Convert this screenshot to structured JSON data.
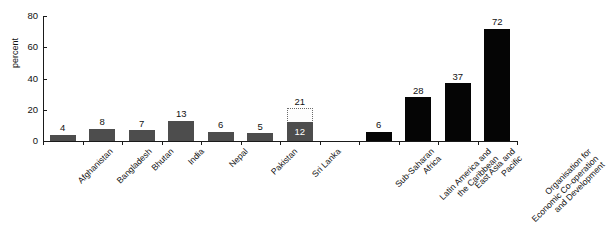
{
  "chart_data": {
    "type": "bar",
    "title": "",
    "subtitle": "",
    "xlabel": "",
    "ylabel": "percent",
    "ylim": [
      0,
      80
    ],
    "yticks": [
      0,
      20,
      40,
      60,
      80
    ],
    "grid": false,
    "legend": "none",
    "categories": [
      "Afghanistan",
      "Bangladesh",
      "Bhutan",
      "India",
      "Nepal",
      "Pakistan",
      "Sri Lanka",
      "Sub-Saharan Africa",
      "Latin America and the Caribbean",
      "East Asia and Pacific",
      "Organisation for Economic Co-operation and Development"
    ],
    "values": [
      4,
      8,
      7,
      13,
      6,
      5,
      12,
      6,
      28,
      37,
      72
    ],
    "value_labels": [
      "4",
      "8",
      "7",
      "13",
      "6",
      "5",
      "12",
      "6",
      "28",
      "37",
      "72"
    ]
  },
  "axis": {
    "y_title": "percent",
    "y_ticks": [
      "0",
      "20",
      "40",
      "60",
      "80"
    ],
    "y_max": 80
  },
  "bars": [
    {
      "name": "afghanistan",
      "label_lines": [
        "Afghanistan"
      ],
      "value": 4,
      "value_label": "4",
      "style": "gray",
      "label_pos": "above",
      "slot": 0
    },
    {
      "name": "bangladesh",
      "label_lines": [
        "Bangladesh"
      ],
      "value": 8,
      "value_label": "8",
      "style": "gray",
      "label_pos": "above",
      "slot": 1
    },
    {
      "name": "bhutan",
      "label_lines": [
        "Bhutan"
      ],
      "value": 7,
      "value_label": "7",
      "style": "gray",
      "label_pos": "above",
      "slot": 2
    },
    {
      "name": "india",
      "label_lines": [
        "India"
      ],
      "value": 13,
      "value_label": "13",
      "style": "gray",
      "label_pos": "above",
      "slot": 3
    },
    {
      "name": "nepal",
      "label_lines": [
        "Nepal"
      ],
      "value": 6,
      "value_label": "6",
      "style": "gray",
      "label_pos": "above",
      "slot": 4
    },
    {
      "name": "pakistan",
      "label_lines": [
        "Pakistan"
      ],
      "value": 5,
      "value_label": "5",
      "style": "gray",
      "label_pos": "above",
      "slot": 5
    },
    {
      "name": "sri-lanka",
      "label_lines": [
        "Sri Lanka"
      ],
      "value": 12,
      "value_label": "12",
      "style": "gray",
      "label_pos": "inside",
      "slot": 6,
      "ghost_value": 21,
      "ghost_value_label": "21"
    },
    {
      "name": "sub-saharan-africa",
      "label_lines": [
        "Sub-Saharan",
        "Africa"
      ],
      "value": 6,
      "value_label": "6",
      "style": "black",
      "label_pos": "above",
      "slot": 8
    },
    {
      "name": "latin-america-caribbean",
      "label_lines": [
        "Latin America and",
        "the Caribbean"
      ],
      "value": 28,
      "value_label": "28",
      "style": "black",
      "label_pos": "above",
      "slot": 9
    },
    {
      "name": "east-asia-pacific",
      "label_lines": [
        "East Asia and",
        "Pacific"
      ],
      "value": 37,
      "value_label": "37",
      "style": "black",
      "label_pos": "above",
      "slot": 10
    },
    {
      "name": "oecd",
      "label_lines": [
        "Organisation for",
        "Economic Co-operation",
        "and Development"
      ],
      "value": 72,
      "value_label": "72",
      "style": "black",
      "label_pos": "above",
      "slot": 11
    }
  ],
  "colors": {
    "bar_gray": "#4d4d4d",
    "bar_black": "#050505",
    "ghost_fill": "#fdfdfd",
    "ghost_border": "#6b6b6b",
    "axis": "#1a1a1a",
    "text": "#111111",
    "background": "#ffffff"
  }
}
